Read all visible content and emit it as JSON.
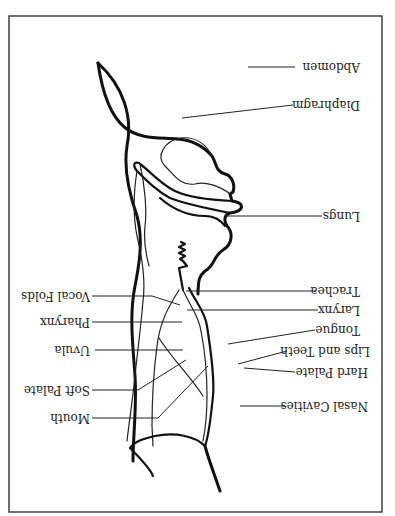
{
  "diagram": {
    "orientation": "rotated 180 degrees",
    "labels": {
      "abdomen": "Abdomen",
      "diaphragm": "Diaphragm",
      "lungs": "Lungs",
      "trachea": "Trachea",
      "larynx": "Larynx",
      "tongue": "Tongue",
      "lips_and_teeth": "Lips and Teeth",
      "hard_palate": "Hard Palate",
      "nasal_cavities": "Nasal Cavities",
      "vocal_folds": "Vocal Folds",
      "pharynx": "Pharynx",
      "uvula": "Uvula",
      "soft_palate": "Soft Palate",
      "mouth": "Mouth"
    }
  }
}
